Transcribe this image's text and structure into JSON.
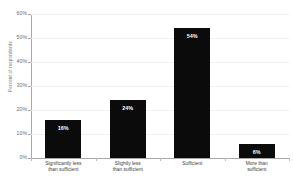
{
  "chart_data": {
    "type": "bar",
    "title": "",
    "xlabel": "",
    "ylabel": "Percent of respondents",
    "ylim": [
      0,
      60
    ],
    "ytick_labels": [
      "60%",
      "50%",
      "40%",
      "30%",
      "20%",
      "10%",
      "0%"
    ],
    "ytick_values": [
      60,
      50,
      40,
      30,
      20,
      10,
      0
    ],
    "grid": true,
    "legend": "none",
    "bar_color": "#0b0b0b",
    "categories": [
      "Significantly less than sufficient",
      "Slightly less than sufficient",
      "Sufficient",
      "More than sufficient"
    ],
    "category_lines": [
      [
        "Significantly less",
        "than sufficient"
      ],
      [
        "Slightly less",
        "than sufficient"
      ],
      [
        "Sufficient",
        ""
      ],
      [
        "More than",
        "sufficient"
      ]
    ],
    "values": [
      16,
      24,
      54,
      6
    ],
    "data_labels": [
      "16%",
      "24%",
      "54%",
      "6%"
    ]
  },
  "axis": {
    "y_title": "Percent of respondents"
  },
  "title_sliver": {
    "text": ""
  }
}
